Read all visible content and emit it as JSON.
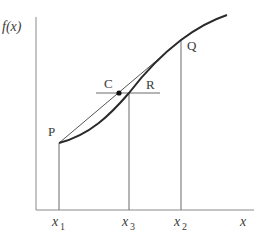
{
  "diagram": {
    "type": "function-graph-chord-tangent",
    "colors": {
      "axis": "#8a8a8a",
      "curve": "#2a2a2a",
      "chord": "#555555",
      "guide": "#6a6a6a",
      "point": "#111111",
      "text": "#3a3a3a"
    },
    "labels": {
      "y_axis": "f(x)",
      "x_axis": "x",
      "point_p": "P",
      "point_q": "Q",
      "point_c": "C",
      "point_r": "R",
      "x1_base": "x",
      "x1_sub": "1",
      "x3_base": "x",
      "x3_sub": "3",
      "x2_base": "x",
      "x2_sub": "2"
    },
    "points": {
      "P": [
        59,
        143
      ],
      "Q": [
        181,
        40
      ],
      "C": [
        119,
        93
      ],
      "curve_end": [
        227,
        15
      ]
    }
  }
}
